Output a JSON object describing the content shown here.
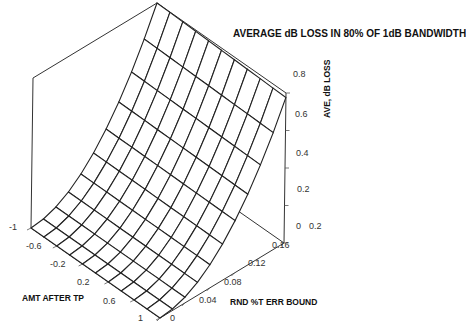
{
  "chart_data": {
    "type": "surface",
    "title": "AVERAGE dB LOSS IN 80% OF 1dB BANDWIDTH",
    "xlabel": "AMT AFTER TP",
    "ylabel": "RND %T ERR BOUND",
    "zlabel": "AVE, dB LOSS",
    "x_ticks": [
      "-1",
      "-0.6",
      "-0.2",
      "0.2",
      "0.6",
      "1"
    ],
    "y_ticks": [
      "0",
      "0.04",
      "0.08",
      "0.12",
      "0.16",
      "0.2"
    ],
    "z_ticks": [
      "0",
      "0.2",
      "0.4",
      "0.6",
      "0.8"
    ],
    "xlim": [
      -1,
      1
    ],
    "ylim": [
      0,
      0.2
    ],
    "zlim": [
      0,
      0.8
    ],
    "grid_x_count": 11,
    "grid_y_count": 11,
    "surface_model": "z approx 0.8*(y/0.2)^2, nearly independent of x",
    "corner_values": [
      {
        "x": -1,
        "y": 0,
        "z": 0.0
      },
      {
        "x": 1,
        "y": 0,
        "z": 0.0
      },
      {
        "x": -1,
        "y": 0.2,
        "z": 0.8
      },
      {
        "x": 1,
        "y": 0.2,
        "z": 0.8
      }
    ],
    "line_color": "#222222",
    "background": "#ffffff"
  }
}
